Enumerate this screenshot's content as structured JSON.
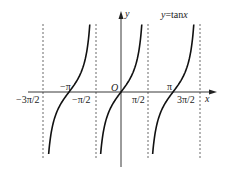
{
  "chart_data": {
    "type": "line",
    "title": "y=tanx",
    "function": "y = tan(x)",
    "xlabel": "x",
    "ylabel": "y",
    "origin_label": "O",
    "x_ticks": [
      {
        "label": "-3π/2",
        "value": -4.712
      },
      {
        "label": "-π",
        "value": -3.1416
      },
      {
        "label": "-π/2",
        "value": -1.5708
      },
      {
        "label": "π/2",
        "value": 1.5708
      },
      {
        "label": "π",
        "value": 3.1416
      },
      {
        "label": "3π/2",
        "value": 4.712
      }
    ],
    "asymptotes": [
      "-3π/2",
      "-π/2",
      "π/2",
      "3π/2"
    ],
    "xlim": [
      -5.0,
      5.4
    ],
    "ylim": [
      -3.5,
      3.5
    ],
    "grid": false,
    "series": [
      {
        "name": "branch_1",
        "x_center": -3.1416,
        "points": [
          [
            -4.6,
            -8.7
          ],
          [
            -4.4,
            -3.1
          ],
          [
            -3.92,
            -1.0
          ],
          [
            -3.1416,
            0
          ],
          [
            -2.36,
            1.0
          ],
          [
            -1.88,
            3.1
          ],
          [
            -1.68,
            8.7
          ]
        ]
      },
      {
        "name": "branch_2",
        "x_center": 0,
        "points": [
          [
            -1.46,
            -8.7
          ],
          [
            -1.26,
            -3.1
          ],
          [
            -0.785,
            -1.0
          ],
          [
            0,
            0
          ],
          [
            0.785,
            1.0
          ],
          [
            1.26,
            3.1
          ],
          [
            1.46,
            8.7
          ]
        ]
      },
      {
        "name": "branch_3",
        "x_center": 3.1416,
        "points": [
          [
            1.68,
            -8.7
          ],
          [
            1.88,
            -3.1
          ],
          [
            2.36,
            -1.0
          ],
          [
            3.1416,
            0
          ],
          [
            3.92,
            1.0
          ],
          [
            4.4,
            3.1
          ],
          [
            4.6,
            8.7
          ]
        ]
      }
    ]
  },
  "labels": {
    "title": "y=tanx",
    "title_y": "y",
    "title_eq": "=tan",
    "title_x": "x",
    "x_axis": "x",
    "y_axis": "y",
    "origin": "O",
    "neg_3pi_2": "−3π/2",
    "neg_pi": "−π",
    "neg_pi_2": "−π/2",
    "pi_2": "π/2",
    "pi": "π",
    "pos_3pi_2": "3π/2"
  }
}
